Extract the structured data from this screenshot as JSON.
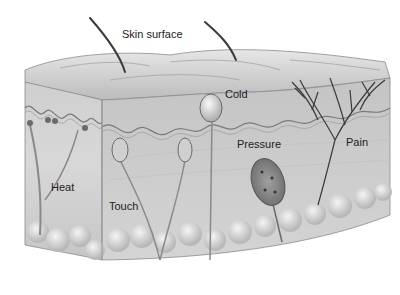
{
  "labels": {
    "skin_surface": "Skin surface",
    "cold": "Cold",
    "pressure": "Pressure",
    "pain": "Pain",
    "heat": "Heat",
    "touch": "Touch"
  },
  "colors": {
    "background": "#ffffff",
    "skin_light": "#d9d9d9",
    "skin_mid": "#bdbdbd",
    "skin_dark": "#8f8f8f",
    "nerve": "#3a3a3a",
    "text": "#222222"
  }
}
